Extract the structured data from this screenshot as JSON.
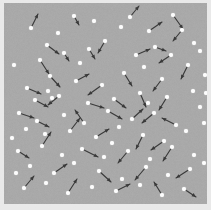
{
  "figure": {
    "type": "vector-field-scatter",
    "title": "",
    "width": 211,
    "height": 210,
    "background_color": "#e9e9e9",
    "plot_background_color": "#a9a9a9",
    "particle_color": "#fdfdfd",
    "vector_color": "#3a3a3a",
    "plot_area": {
      "x": 4,
      "y": 3,
      "width": 203,
      "height": 201
    }
  },
  "chart_data": {
    "type": "scatter",
    "title": "",
    "xlabel": "",
    "ylabel": "",
    "xlim": [
      0,
      203
    ],
    "ylim": [
      0,
      201
    ],
    "grid": false,
    "legend": "none",
    "axis_ticks": [],
    "particle_radius": 2.1,
    "particle_count": 88,
    "vector_count": 47,
    "particles": [
      [
        70,
        13
      ],
      [
        90,
        18
      ],
      [
        126,
        14
      ],
      [
        169,
        12
      ],
      [
        27,
        25
      ],
      [
        117,
        24
      ],
      [
        145,
        28
      ],
      [
        178,
        27
      ],
      [
        43,
        42
      ],
      [
        60,
        50
      ],
      [
        85,
        46
      ],
      [
        132,
        52
      ],
      [
        151,
        44
      ],
      [
        190,
        40
      ],
      [
        36,
        57
      ],
      [
        101,
        38
      ],
      [
        167,
        52
      ],
      [
        196,
        48
      ],
      [
        23,
        85
      ],
      [
        46,
        73
      ],
      [
        72,
        78
      ],
      [
        98,
        82
      ],
      [
        120,
        70
      ],
      [
        140,
        64
      ],
      [
        158,
        76
      ],
      [
        184,
        62
      ],
      [
        201,
        72
      ],
      [
        31,
        97
      ],
      [
        55,
        93
      ],
      [
        84,
        100
      ],
      [
        110,
        96
      ],
      [
        136,
        90
      ],
      [
        163,
        94
      ],
      [
        189,
        88
      ],
      [
        44,
        88
      ],
      [
        48,
        95
      ],
      [
        15,
        110
      ],
      [
        33,
        118
      ],
      [
        60,
        112
      ],
      [
        80,
        120
      ],
      [
        104,
        108
      ],
      [
        128,
        116
      ],
      [
        150,
        110
      ],
      [
        172,
        122
      ],
      [
        196,
        104
      ],
      [
        22,
        126
      ],
      [
        41,
        131
      ],
      [
        66,
        128
      ],
      [
        92,
        134
      ],
      [
        115,
        124
      ],
      [
        139,
        132
      ],
      [
        160,
        138
      ],
      [
        182,
        128
      ],
      [
        14,
        148
      ],
      [
        38,
        143
      ],
      [
        58,
        152
      ],
      [
        78,
        146
      ],
      [
        100,
        154
      ],
      [
        124,
        148
      ],
      [
        146,
        156
      ],
      [
        168,
        144
      ],
      [
        190,
        152
      ],
      [
        26,
        163
      ],
      [
        50,
        170
      ],
      [
        70,
        160
      ],
      [
        95,
        168
      ],
      [
        118,
        176
      ],
      [
        142,
        164
      ],
      [
        164,
        172
      ],
      [
        186,
        166
      ],
      [
        20,
        185
      ],
      [
        42,
        180
      ],
      [
        64,
        190
      ],
      [
        88,
        184
      ],
      [
        112,
        188
      ],
      [
        136,
        182
      ],
      [
        158,
        192
      ],
      [
        180,
        186
      ],
      [
        10,
        62
      ],
      [
        200,
        120
      ],
      [
        12,
        170
      ],
      [
        200,
        160
      ],
      [
        8,
        135
      ],
      [
        202,
        90
      ],
      [
        54,
        30
      ],
      [
        144,
        100
      ],
      [
        76,
        60
      ],
      [
        108,
        140
      ]
    ],
    "vectors": [
      {
        "x": 27,
        "y": 25,
        "dx": 7,
        "dy": -14
      },
      {
        "x": 70,
        "y": 13,
        "dx": 5,
        "dy": 9
      },
      {
        "x": 126,
        "y": 14,
        "dx": 9,
        "dy": -11
      },
      {
        "x": 145,
        "y": 28,
        "dx": 13,
        "dy": -9
      },
      {
        "x": 169,
        "y": 12,
        "dx": 10,
        "dy": 14
      },
      {
        "x": 178,
        "y": 27,
        "dx": -9,
        "dy": 11
      },
      {
        "x": 43,
        "y": 42,
        "dx": 12,
        "dy": 9
      },
      {
        "x": 60,
        "y": 50,
        "dx": 5,
        "dy": 8
      },
      {
        "x": 85,
        "y": 46,
        "dx": 6,
        "dy": 10
      },
      {
        "x": 101,
        "y": 38,
        "dx": -7,
        "dy": 12
      },
      {
        "x": 132,
        "y": 52,
        "dx": 14,
        "dy": -6
      },
      {
        "x": 151,
        "y": 44,
        "dx": 11,
        "dy": 4
      },
      {
        "x": 36,
        "y": 57,
        "dx": 9,
        "dy": 14
      },
      {
        "x": 167,
        "y": 52,
        "dx": -12,
        "dy": 8
      },
      {
        "x": 23,
        "y": 85,
        "dx": 14,
        "dy": 6
      },
      {
        "x": 46,
        "y": 73,
        "dx": 10,
        "dy": 11
      },
      {
        "x": 72,
        "y": 78,
        "dx": 13,
        "dy": -7
      },
      {
        "x": 98,
        "y": 82,
        "dx": -14,
        "dy": 10
      },
      {
        "x": 120,
        "y": 70,
        "dx": 8,
        "dy": 13
      },
      {
        "x": 158,
        "y": 76,
        "dx": -9,
        "dy": 12
      },
      {
        "x": 184,
        "y": 62,
        "dx": -7,
        "dy": 14
      },
      {
        "x": 84,
        "y": 100,
        "dx": 16,
        "dy": 5
      },
      {
        "x": 110,
        "y": 96,
        "dx": 12,
        "dy": 9
      },
      {
        "x": 55,
        "y": 93,
        "dx": -11,
        "dy": 9
      },
      {
        "x": 31,
        "y": 97,
        "dx": 13,
        "dy": 7
      },
      {
        "x": 136,
        "y": 90,
        "dx": 6,
        "dy": 14
      },
      {
        "x": 163,
        "y": 94,
        "dx": -8,
        "dy": 13
      },
      {
        "x": 80,
        "y": 120,
        "dx": -9,
        "dy": -13
      },
      {
        "x": 104,
        "y": 108,
        "dx": 14,
        "dy": 8
      },
      {
        "x": 128,
        "y": 116,
        "dx": 11,
        "dy": -10
      },
      {
        "x": 150,
        "y": 110,
        "dx": -12,
        "dy": 10
      },
      {
        "x": 172,
        "y": 122,
        "dx": -14,
        "dy": -7
      },
      {
        "x": 33,
        "y": 118,
        "dx": 12,
        "dy": 6
      },
      {
        "x": 15,
        "y": 110,
        "dx": 15,
        "dy": 5
      },
      {
        "x": 66,
        "y": 128,
        "dx": 10,
        "dy": -13
      },
      {
        "x": 92,
        "y": 134,
        "dx": 13,
        "dy": -8
      },
      {
        "x": 139,
        "y": 132,
        "dx": -7,
        "dy": 14
      },
      {
        "x": 160,
        "y": 138,
        "dx": -13,
        "dy": 9
      },
      {
        "x": 38,
        "y": 143,
        "dx": 9,
        "dy": -14
      },
      {
        "x": 14,
        "y": 148,
        "dx": 11,
        "dy": 7
      },
      {
        "x": 78,
        "y": 146,
        "dx": 16,
        "dy": 8
      },
      {
        "x": 124,
        "y": 148,
        "dx": -10,
        "dy": 12
      },
      {
        "x": 168,
        "y": 144,
        "dx": -9,
        "dy": 14
      },
      {
        "x": 50,
        "y": 170,
        "dx": 13,
        "dy": -9
      },
      {
        "x": 95,
        "y": 168,
        "dx": 12,
        "dy": 11
      },
      {
        "x": 142,
        "y": 164,
        "dx": -11,
        "dy": 13
      },
      {
        "x": 186,
        "y": 166,
        "dx": -14,
        "dy": 9
      },
      {
        "x": 20,
        "y": 185,
        "dx": 10,
        "dy": -12
      },
      {
        "x": 64,
        "y": 190,
        "dx": 9,
        "dy": -14
      },
      {
        "x": 112,
        "y": 188,
        "dx": 14,
        "dy": -7
      },
      {
        "x": 158,
        "y": 192,
        "dx": -8,
        "dy": -13
      },
      {
        "x": 180,
        "y": 186,
        "dx": 12,
        "dy": 8
      }
    ]
  }
}
